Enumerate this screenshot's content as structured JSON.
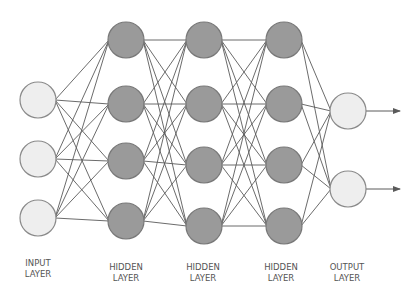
{
  "diagram": {
    "colors": {
      "io_fill": "#eeeeee",
      "io_stroke": "#8a8a8a",
      "hidden_fill": "#9a9a9a",
      "hidden_stroke": "#787878",
      "edge": "#5a5a5a"
    },
    "node_radius": 18,
    "layers": [
      {
        "name": "input",
        "label_line1": "INPUT",
        "label_line2": "LAYER",
        "type": "io",
        "x": 38,
        "ys": [
          100,
          159,
          218
        ],
        "label_x": 38
      },
      {
        "name": "hidden-1",
        "label_line1": "HIDDEN",
        "label_line2": "LAYER",
        "type": "hidden",
        "x": 126,
        "ys": [
          40,
          104,
          161,
          221
        ],
        "label_x": 126
      },
      {
        "name": "hidden-2",
        "label_line1": "HIDDEN",
        "label_line2": "LAYER",
        "type": "hidden",
        "x": 204,
        "ys": [
          40,
          104,
          165,
          226
        ],
        "label_x": 203
      },
      {
        "name": "hidden-3",
        "label_line1": "HIDDEN",
        "label_line2": "LAYER",
        "type": "hidden",
        "x": 284,
        "ys": [
          40,
          104,
          165,
          226
        ],
        "label_x": 281
      },
      {
        "name": "output",
        "label_line1": "OUTPUT",
        "label_line2": "LAYER",
        "type": "io",
        "x": 348,
        "ys": [
          111,
          189
        ],
        "label_x": 347
      }
    ],
    "output_arrows": {
      "end_x": 400
    }
  }
}
